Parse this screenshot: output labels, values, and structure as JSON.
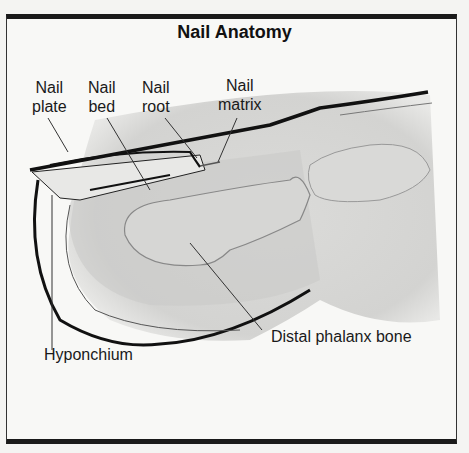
{
  "title": "Nail Anatomy",
  "labels": {
    "nail_plate": [
      "Nail",
      "plate"
    ],
    "nail_bed": [
      "Nail",
      "bed"
    ],
    "nail_root": [
      "Nail",
      "root"
    ],
    "nail_matrix": [
      "Nail",
      "matrix"
    ],
    "distal_phalanx": "Distal phalanx bone",
    "hyponchium": "Hyponchium"
  }
}
